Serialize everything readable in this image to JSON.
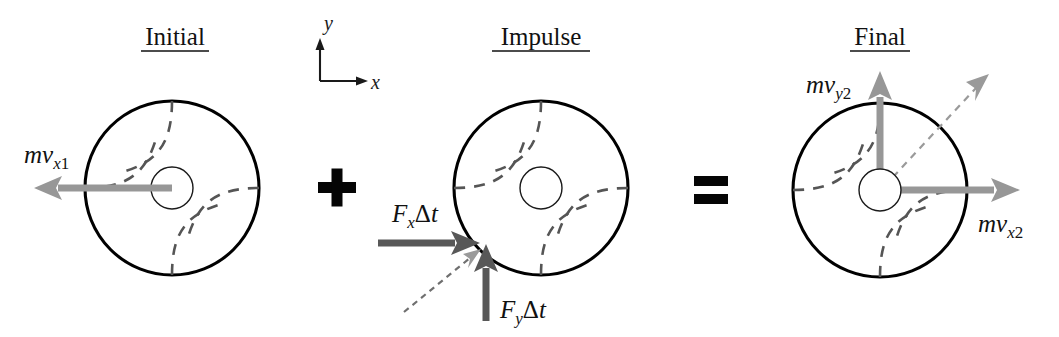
{
  "figure": {
    "background_color": "#ffffff",
    "width": 1059,
    "height": 337
  },
  "colors": {
    "outline": "#000000",
    "swirl_dashed": "#555555",
    "momentum_arrow": "#979797",
    "impulse_arrow": "#585858",
    "resultant_dashed": "#9a9a9a",
    "axis": "#1a1a1a",
    "text": "#111111"
  },
  "axes_legend": {
    "name": "coordinate-axes",
    "x_label": "x",
    "y_label": "y",
    "origin": [
      320,
      81
    ],
    "x_tip": [
      368,
      81
    ],
    "y_tip": [
      320,
      41
    ]
  },
  "operators": {
    "plus": "+",
    "equals": "="
  },
  "panels": [
    {
      "id": "initial",
      "title": "Initial",
      "title_underlined": true,
      "title_x": 175,
      "title_y": 45,
      "ball": {
        "cx": 172,
        "cy": 188,
        "r": 87
      },
      "vectors": [
        {
          "name": "mv-x1-vector",
          "label_parts": {
            "lead": "m",
            "v": "v",
            "sub": "x1"
          },
          "label_text": "mvx1",
          "from": [
            172,
            188
          ],
          "to": [
            36,
            188
          ],
          "style": "momentum",
          "label_x": 24,
          "label_y": 163
        }
      ]
    },
    {
      "id": "impulse",
      "title": "Impulse",
      "title_underlined": true,
      "title_x": 541,
      "title_y": 45,
      "ball": {
        "cx": 541,
        "cy": 188,
        "r": 87
      },
      "vectors": [
        {
          "name": "fx-delta-t-vector",
          "label_parts": {
            "lead": "F",
            "sub": "x",
            "tail": "Δt"
          },
          "label_text": "FxΔt",
          "from": [
            378,
            243
          ],
          "to": [
            476,
            243
          ],
          "style": "impulse",
          "label_x": 392,
          "label_y": 222
        },
        {
          "name": "fy-delta-t-vector",
          "label_parts": {
            "lead": "F",
            "sub": "y",
            "tail": "Δt"
          },
          "label_text": "FyΔt",
          "from": [
            486,
            321
          ],
          "to": [
            486,
            245
          ],
          "style": "impulse",
          "label_x": 500,
          "label_y": 318
        },
        {
          "name": "impulse-resultant-dashed-vector",
          "label_text": "",
          "from": [
            404,
            310
          ],
          "to": [
            478,
            250
          ],
          "style": "dashed-resultant"
        }
      ]
    },
    {
      "id": "final",
      "title": "Final",
      "title_underlined": true,
      "title_x": 880,
      "title_y": 45,
      "ball": {
        "cx": 880,
        "cy": 190,
        "r": 87
      },
      "vectors": [
        {
          "name": "mv-y2-vector",
          "label_parts": {
            "lead": "m",
            "v": "v",
            "sub": "y2"
          },
          "label_text": "mvy2",
          "from": [
            880,
            190
          ],
          "to": [
            880,
            73
          ],
          "style": "momentum",
          "label_x": 808,
          "label_y": 93
        },
        {
          "name": "mv-x2-vector",
          "label_parts": {
            "lead": "m",
            "v": "v",
            "sub": "x2"
          },
          "label_text": "mvx2",
          "from": [
            880,
            190
          ],
          "to": [
            1018,
            190
          ],
          "style": "momentum",
          "label_x": 980,
          "label_y": 232
        },
        {
          "name": "mv-resultant-dashed-vector",
          "label_text": "",
          "from": [
            880,
            190
          ],
          "to": [
            986,
            76
          ],
          "style": "dashed-resultant"
        }
      ]
    }
  ]
}
